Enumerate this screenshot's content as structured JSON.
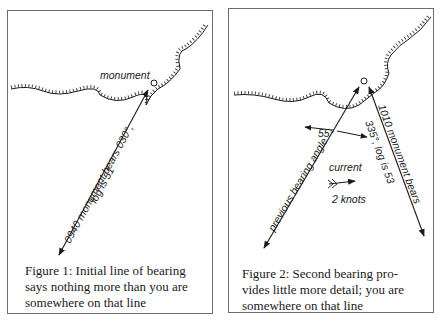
{
  "figures": [
    {
      "id": "figure-1",
      "labels": {
        "monument": "monument",
        "bearing_line_1": "0940 monument bears 030°,",
        "bearing_line_2": "log is 51"
      },
      "caption": {
        "line1": "Figure 1: Initial line of bearing",
        "line2": "says nothing more than you are",
        "line3": "somewhere on that line"
      }
    },
    {
      "id": "figure-2",
      "labels": {
        "previous_bearing": "previous bearing angle",
        "angle": "55°",
        "bearing_line_1": "1010 monument bears",
        "bearing_line_2": "335°, log is 53",
        "current_line_1": "current",
        "current_line_2": "2 knots"
      },
      "caption": {
        "line1": "Figure 2: Second bearing pro-",
        "line2": "vides little more detail; you are",
        "line3": "somewhere on that line"
      }
    }
  ],
  "colors": {
    "ink": "#1a1a1a",
    "frame": "#6d6d6d",
    "background": "#ffffff"
  }
}
